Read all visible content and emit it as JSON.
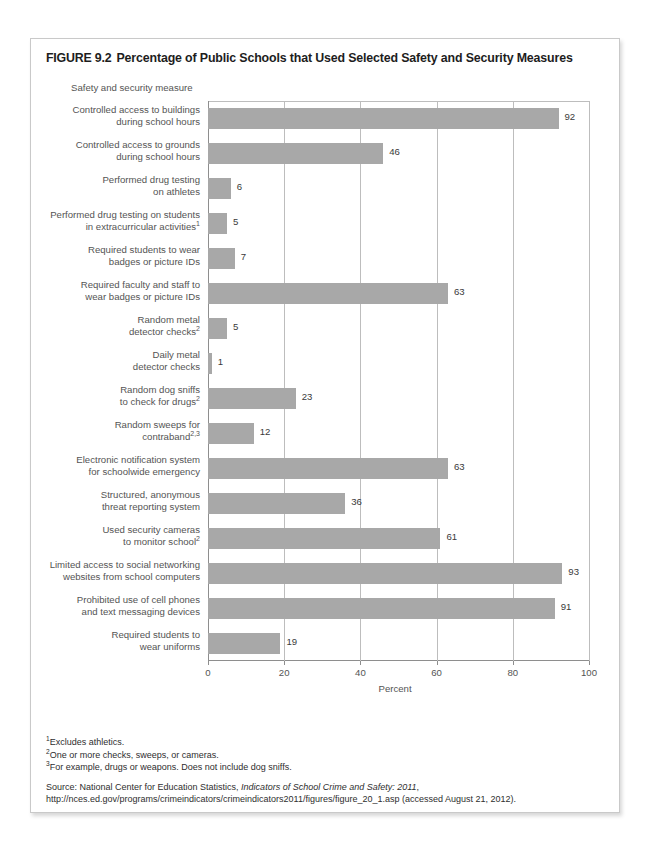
{
  "figure": {
    "number": "FIGURE 9.2",
    "title": "Percentage of Public Schools that Used Selected Safety and Security Measures",
    "axis_group_title": "Safety and security measure"
  },
  "chart_data": {
    "type": "bar",
    "orientation": "horizontal",
    "title": "Percentage of Public Schools that Used Selected Safety and Security Measures",
    "xlabel": "Percent",
    "ylabel": "Safety and security measure",
    "xlim": [
      0,
      100
    ],
    "xticks": [
      0,
      20,
      40,
      60,
      80,
      100
    ],
    "xtick_labels": [
      "0",
      "20",
      "40",
      "60",
      "80",
      "100"
    ],
    "grid": true,
    "legend": "none",
    "bar_color": "#a8a8a8",
    "categories": [
      "Controlled access to buildings during school hours",
      "Controlled access to grounds during school hours",
      "Performed drug testing on athletes",
      "Performed drug testing on students in extracurricular activities",
      "Required students to wear badges or picture IDs",
      "Required faculty and staff to wear badges or picture IDs",
      "Random metal detector checks",
      "Daily metal detector checks",
      "Random dog sniffs to check for drugs",
      "Random sweeps for contraband",
      "Electronic notification system for schoolwide emergency",
      "Structured, anonymous threat reporting system",
      "Used security cameras to monitor school",
      "Limited access to social networking websites from school computers",
      "Prohibited use of cell phones and text messaging devices",
      "Required students to wear uniforms"
    ],
    "values": [
      92,
      46,
      6,
      5,
      7,
      63,
      5,
      1,
      23,
      12,
      63,
      36,
      61,
      93,
      91,
      19
    ]
  },
  "rows": [
    {
      "line1": "Controlled access to buildings",
      "line2": "during school hours",
      "footnote": "",
      "value": 92,
      "value_label": "92"
    },
    {
      "line1": "Controlled access to grounds",
      "line2": "during school hours",
      "footnote": "",
      "value": 46,
      "value_label": "46"
    },
    {
      "line1": "Performed drug testing",
      "line2": "on athletes",
      "footnote": "",
      "value": 6,
      "value_label": "6"
    },
    {
      "line1": "Performed drug testing on students",
      "line2": "in extracurricular activities",
      "footnote": "1",
      "value": 5,
      "value_label": "5"
    },
    {
      "line1": "Required students to wear",
      "line2": "badges or picture IDs",
      "footnote": "",
      "value": 7,
      "value_label": "7"
    },
    {
      "line1": "Required faculty and staff to",
      "line2": "wear badges or picture IDs",
      "footnote": "",
      "value": 63,
      "value_label": "63"
    },
    {
      "line1": "Random metal",
      "line2": "detector checks",
      "footnote": "2",
      "value": 5,
      "value_label": "5"
    },
    {
      "line1": "Daily metal",
      "line2": "detector checks",
      "footnote": "",
      "value": 1,
      "value_label": "1"
    },
    {
      "line1": "Random dog sniffs",
      "line2": "to check for drugs",
      "footnote": "2",
      "value": 23,
      "value_label": "23"
    },
    {
      "line1": "Random sweeps for",
      "line2": "contraband",
      "footnote": "2,3",
      "value": 12,
      "value_label": "12"
    },
    {
      "line1": "Electronic notification system",
      "line2": "for schoolwide emergency",
      "footnote": "",
      "value": 63,
      "value_label": "63"
    },
    {
      "line1": "Structured, anonymous",
      "line2": "threat reporting system",
      "footnote": "",
      "value": 36,
      "value_label": "36"
    },
    {
      "line1": "Used security cameras",
      "line2": "to monitor school",
      "footnote": "2",
      "value": 61,
      "value_label": "61"
    },
    {
      "line1": "Limited access to social networking",
      "line2": "websites from school computers",
      "footnote": "",
      "value": 93,
      "value_label": "93"
    },
    {
      "line1": "Prohibited use of cell phones",
      "line2": "and text messaging devices",
      "footnote": "",
      "value": 91,
      "value_label": "91"
    },
    {
      "line1": "Required students to",
      "line2": "wear uniforms",
      "footnote": "",
      "value": 19,
      "value_label": "19"
    }
  ],
  "axis": {
    "tick_labels": [
      "0",
      "20",
      "40",
      "60",
      "80",
      "100"
    ],
    "tick_values": [
      0,
      20,
      40,
      60,
      80,
      100
    ],
    "percent_label": "Percent"
  },
  "notes": [
    {
      "marker": "1",
      "text": "Excludes athletics."
    },
    {
      "marker": "2",
      "text": "One or more checks, sweeps, or cameras."
    },
    {
      "marker": "3",
      "text": "For example, drugs or weapons. Does not include dog sniffs."
    }
  ],
  "source": {
    "prefix": "Source: National Center for Education Statistics, ",
    "italic": "Indicators of School Crime and Safety: 2011",
    "suffix": ", http://nces.ed.gov/programs/crimeindicators/crimeindicators2011/figures/figure_20_1.asp (accessed August 21, 2012)."
  }
}
